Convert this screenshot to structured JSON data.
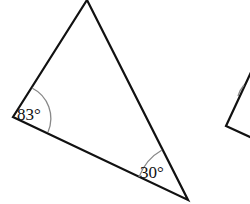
{
  "diagram": {
    "type": "geometry-triangle",
    "triangle": {
      "vertices": {
        "top": [
          87,
          0
        ],
        "left": [
          13,
          117
        ],
        "bottom_right": [
          188,
          200
        ]
      },
      "angles": [
        {
          "vertex": "left",
          "label": "83°"
        },
        {
          "vertex": "bottom_right",
          "label": "30°"
        }
      ]
    },
    "partial_shape": {
      "note": "second triangle cut off at right edge"
    },
    "colors": {
      "stroke": "#111111",
      "arc": "#888888",
      "background": "#ffffff"
    }
  }
}
